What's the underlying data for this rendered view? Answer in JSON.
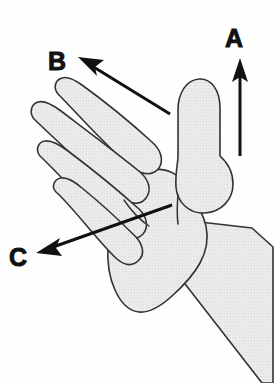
{
  "figure": {
    "background_color": "#fefefe",
    "hand_fill_color": "#e8e8e8",
    "hand_outline_color": "#333333",
    "arrow_color": "#111111",
    "label_color": "#111111"
  },
  "labels": [
    {
      "id": "label-a",
      "text": "A",
      "x": 234,
      "y": 47,
      "direction": "up",
      "meaning": "thumb direction"
    },
    {
      "id": "label-b",
      "text": "B",
      "x": 57,
      "y": 70,
      "direction": "up-left",
      "meaning": "fingers direction"
    },
    {
      "id": "label-c",
      "text": "C",
      "x": 18,
      "y": 266,
      "direction": "down-left",
      "meaning": "palm direction"
    }
  ],
  "arrows": [
    {
      "id": "arrow-a",
      "label": "A",
      "tail_x": 240,
      "tail_y": 156,
      "head_x": 240,
      "head_y": 60
    },
    {
      "id": "arrow-b",
      "label": "B",
      "tail_x": 170,
      "tail_y": 114,
      "head_x": 79,
      "head_y": 58
    },
    {
      "id": "arrow-c",
      "label": "C",
      "tail_x": 172,
      "tail_y": 205,
      "head_x": 36,
      "head_y": 253
    }
  ]
}
